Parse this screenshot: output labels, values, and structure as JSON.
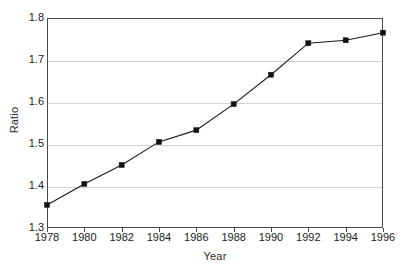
{
  "chart_data": {
    "type": "line",
    "title": "",
    "xlabel": "Year",
    "ylabel": "Ratio",
    "categories": [
      1978,
      1980,
      1982,
      1984,
      1986,
      1988,
      1990,
      1992,
      1994,
      1996
    ],
    "x": [
      1978,
      1980,
      1982,
      1984,
      1986,
      1988,
      1990,
      1992,
      1994,
      1996
    ],
    "values": [
      1.355,
      1.405,
      1.45,
      1.505,
      1.533,
      1.595,
      1.665,
      1.74,
      1.747,
      1.765
    ],
    "series": [
      {
        "name": "Ratio",
        "values": [
          1.355,
          1.405,
          1.45,
          1.505,
          1.533,
          1.595,
          1.665,
          1.74,
          1.747,
          1.765
        ]
      }
    ],
    "xlim": [
      1978,
      1996
    ],
    "ylim": [
      1.3,
      1.8
    ],
    "xticks": [
      1978,
      1980,
      1982,
      1984,
      1986,
      1988,
      1990,
      1992,
      1994,
      1996
    ],
    "xtick_labels": [
      "1978",
      "1980",
      "1982",
      "1984",
      "1986",
      "1988",
      "1990",
      "1992",
      "1994",
      "1996"
    ],
    "yticks": [
      1.3,
      1.4,
      1.5,
      1.6,
      1.7,
      1.8
    ],
    "ytick_labels": [
      "1.3",
      "1.4",
      "1.5",
      "1.6",
      "1.7",
      "1.8"
    ],
    "grid": "horizontal",
    "legend": "none",
    "marker": "square",
    "line_color": "#1a1a1a",
    "marker_color": "#111111",
    "grid_color": "#d2d2d2",
    "axis_color": "#4a4a4a",
    "background_color": "#ffffff"
  }
}
